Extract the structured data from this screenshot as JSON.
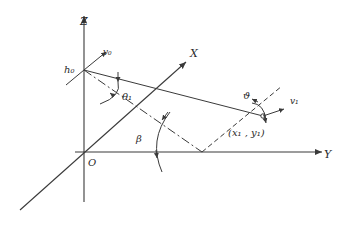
{
  "diagram": {
    "type": "3d-coordinate-geometry",
    "axes": {
      "z_label": "Z",
      "x_label": "X",
      "y_label": "Y",
      "origin_label": "O"
    },
    "points": {
      "launch_height_label": "h₀",
      "target_label": "(x₁ , y₁)"
    },
    "vectors": {
      "initial_velocity_label": "v₀",
      "target_velocity_label": "v₁"
    },
    "angles": {
      "theta_label": "θ₁",
      "beta_label": "β",
      "vartheta_label": "ϑ"
    },
    "colors": {
      "ink": "#3a3a3a",
      "background": "#ffffff"
    }
  }
}
